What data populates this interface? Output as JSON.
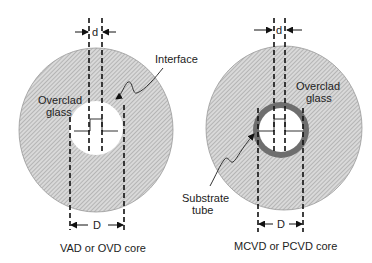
{
  "diagram": {
    "left": {
      "title": "VAD or OVD core",
      "labels": {
        "overclad_line1": "Overclad",
        "overclad_line2": "glass",
        "interface": "Interface",
        "small_dim": "d",
        "large_dim": "D"
      }
    },
    "right": {
      "title": "MCVD or PCVD core",
      "labels": {
        "overclad_line1": "Overclad",
        "overclad_line2": "glass",
        "substrate_line1": "Substrate",
        "substrate_line2": "tube",
        "small_dim": "d",
        "large_dim": "D"
      }
    },
    "colors": {
      "hatch_fill": "#d9d9d9",
      "hatch_line": "#8a8a8a",
      "substrate_ring": "#6e6e6e",
      "core": "#ffffff",
      "line": "#111111"
    }
  }
}
